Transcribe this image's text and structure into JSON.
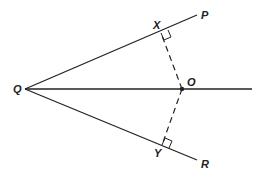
{
  "diagram": {
    "labels": {
      "Q": "Q",
      "P": "P",
      "X": "X",
      "O": "O",
      "Y": "Y",
      "R": "R"
    }
  }
}
